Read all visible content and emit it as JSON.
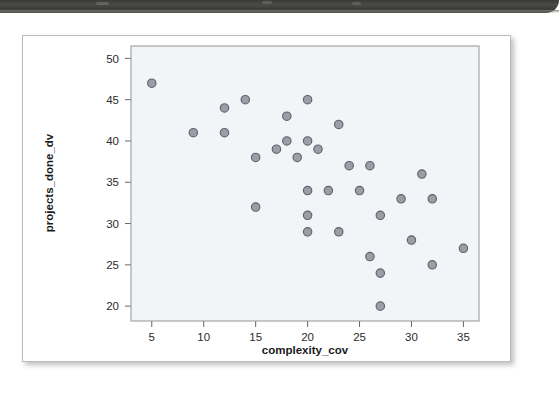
{
  "page": {
    "background_color": "#ffffff",
    "scan_band": {
      "name": "scanned-page-edge",
      "color": "#3f3f3c"
    },
    "card": {
      "background_color": "#ffffff",
      "border_color": "#b9bbbd"
    }
  },
  "chart_data": {
    "type": "scatter",
    "title": "",
    "xlabel": "complexity_cov",
    "ylabel": "projects_done_dv",
    "xlim": [
      3.0,
      36.5
    ],
    "ylim": [
      18.2,
      51.5
    ],
    "xticks": [
      5,
      10,
      15,
      20,
      25,
      30,
      35
    ],
    "yticks": [
      20,
      25,
      30,
      35,
      40,
      45,
      50
    ],
    "xtick_labels": [
      "5",
      "10",
      "15",
      "20",
      "25",
      "30",
      "35"
    ],
    "ytick_labels": [
      "20",
      "25",
      "30",
      "35",
      "40",
      "45",
      "50"
    ],
    "grid": false,
    "legend": null,
    "marker": {
      "shape": "circle",
      "fill_color": "#9b9ea6",
      "edge_color": "#5f636b",
      "size_px": 6.2
    },
    "panel_background": "#f2f4f7",
    "panel_border": "#9a9da1",
    "points": [
      {
        "x": 5,
        "y": 47
      },
      {
        "x": 9,
        "y": 41
      },
      {
        "x": 12,
        "y": 44
      },
      {
        "x": 12,
        "y": 41
      },
      {
        "x": 14,
        "y": 45
      },
      {
        "x": 15,
        "y": 38
      },
      {
        "x": 15,
        "y": 32
      },
      {
        "x": 17,
        "y": 39
      },
      {
        "x": 18,
        "y": 43
      },
      {
        "x": 18,
        "y": 40
      },
      {
        "x": 19,
        "y": 38
      },
      {
        "x": 20,
        "y": 45
      },
      {
        "x": 20,
        "y": 40
      },
      {
        "x": 20,
        "y": 34
      },
      {
        "x": 20,
        "y": 31
      },
      {
        "x": 20,
        "y": 29
      },
      {
        "x": 21,
        "y": 39
      },
      {
        "x": 22,
        "y": 34
      },
      {
        "x": 23,
        "y": 42
      },
      {
        "x": 23,
        "y": 29
      },
      {
        "x": 24,
        "y": 37
      },
      {
        "x": 25,
        "y": 34
      },
      {
        "x": 26,
        "y": 37
      },
      {
        "x": 26,
        "y": 26
      },
      {
        "x": 27,
        "y": 31
      },
      {
        "x": 27,
        "y": 24
      },
      {
        "x": 27,
        "y": 20
      },
      {
        "x": 29,
        "y": 33
      },
      {
        "x": 30,
        "y": 28
      },
      {
        "x": 31,
        "y": 36
      },
      {
        "x": 32,
        "y": 33
      },
      {
        "x": 32,
        "y": 25
      },
      {
        "x": 35,
        "y": 27
      }
    ]
  }
}
